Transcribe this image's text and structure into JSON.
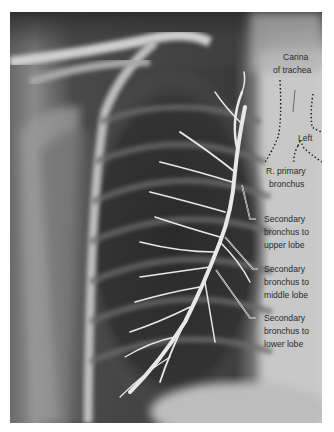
{
  "figure": {
    "labels": {
      "carina": [
        "Carina",
        "of trachea"
      ],
      "left": "Left",
      "r_primary": [
        "R. primary",
        "bronchus"
      ],
      "upper": [
        "Secondary",
        "bronchus to",
        "upper lobe"
      ],
      "middle": [
        "Secondary",
        "bronchus to",
        "middle lobe"
      ],
      "lower": [
        "Secondary",
        "bronchus to",
        "lower lobe"
      ]
    }
  }
}
